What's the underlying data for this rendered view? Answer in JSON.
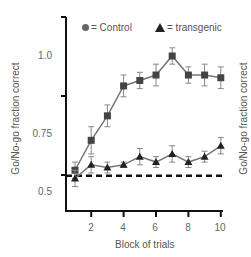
{
  "chart_data": {
    "type": "line",
    "title": "",
    "xlabel": "Block of trials",
    "ylabel": "Go/No-go fraction correct",
    "x": [
      1,
      2,
      3,
      4,
      5,
      6,
      7,
      8,
      9,
      10
    ],
    "xticks": [
      "2",
      "4",
      "6",
      "8",
      "10"
    ],
    "yticks": [
      "1.0",
      "0.75",
      "0.5"
    ],
    "ylim": [
      0.45,
      1.15
    ],
    "grid": false,
    "legend_position": "top",
    "reference_line": {
      "label": "chance",
      "y": 0.56,
      "style": "dashed"
    },
    "series": [
      {
        "name": "Control",
        "marker": "square",
        "legend_marker": "circle",
        "color": "#444444",
        "values": [
          0.58,
          0.69,
          0.78,
          0.89,
          0.91,
          0.93,
          1.0,
          0.93,
          0.93,
          0.92
        ],
        "errors": [
          0.03,
          0.05,
          0.04,
          0.04,
          0.03,
          0.04,
          0.03,
          0.03,
          0.04,
          0.04
        ]
      },
      {
        "name": "transgenic",
        "marker": "triangle",
        "legend_marker": "triangle",
        "color": "#222222",
        "values": [
          0.55,
          0.6,
          0.59,
          0.6,
          0.63,
          0.61,
          0.64,
          0.61,
          0.63,
          0.67
        ],
        "errors": [
          0.03,
          0.03,
          0.02,
          0.01,
          0.03,
          0.02,
          0.03,
          0.02,
          0.02,
          0.03
        ]
      }
    ]
  },
  "legend": {
    "control_label": "= Control",
    "transgenic_label": "= transgenic"
  },
  "axes": {
    "ylabel_left": "Go/No-go fraction correct",
    "ylabel_right_clipped": "Go/No-go fraction correct",
    "xlabel": "Block of trials",
    "ytick_1": "1.0",
    "ytick_075": "0.75",
    "ytick_05": "0.5",
    "xtick_2": "2",
    "xtick_4": "4",
    "xtick_6": "6",
    "xtick_8": "8",
    "xtick_10": "10"
  }
}
